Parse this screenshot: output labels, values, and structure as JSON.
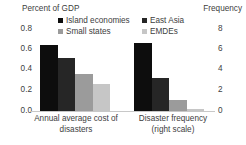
{
  "chart_data": {
    "type": "bar",
    "title": "",
    "categories": [
      "Annual average cost of disasters",
      "Disaster frequency (right scale)"
    ],
    "series": [
      {
        "name": "Island economies",
        "color": "#0d0d0d",
        "values": [
          0.64,
          6.6
        ]
      },
      {
        "name": "East Asia",
        "color": "#262626",
        "values": [
          0.52,
          3.2
        ]
      },
      {
        "name": "Small states",
        "color": "#9b9b9b",
        "values": [
          0.36,
          1.1
        ]
      },
      {
        "name": "EMDEs",
        "color": "#c6c6c6",
        "values": [
          0.26,
          0.2
        ]
      }
    ],
    "left_axis": {
      "label": "Percent of GDP",
      "ticks": [
        "0.0",
        "0.2",
        "0.4",
        "0.6",
        "0.8"
      ],
      "ylim": [
        0,
        0.8
      ]
    },
    "right_axis": {
      "label": "Frequency",
      "ticks": [
        "0",
        "2",
        "4",
        "6",
        "8"
      ],
      "ylim": [
        0,
        8
      ]
    },
    "grid": false,
    "legend_position": "top"
  },
  "legend": {
    "items": [
      {
        "label": "Island economies",
        "color": "#0d0d0d"
      },
      {
        "label": "East Asia",
        "color": "#262626"
      },
      {
        "label": "Small states",
        "color": "#9b9b9b"
      },
      {
        "label": "EMDEs",
        "color": "#c6c6c6"
      }
    ]
  },
  "axis_titles": {
    "left": "Percent of GDP",
    "right": "Frequency"
  },
  "y_left_ticks": [
    "0.8",
    "0.6",
    "0.4",
    "0.2",
    "0.0"
  ],
  "y_right_ticks": [
    "8",
    "6",
    "4",
    "2",
    "0"
  ],
  "category_labels": [
    "Annual average cost of disasters",
    "Disaster frequency (right scale)"
  ]
}
